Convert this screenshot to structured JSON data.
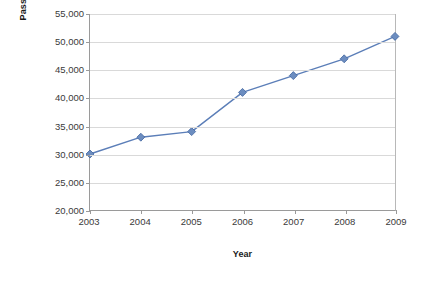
{
  "chart_data": {
    "type": "line",
    "title": "",
    "xlabel": "Year",
    "ylabel": "Passengers per day",
    "categories": [
      "2003",
      "2004",
      "2005",
      "2006",
      "2007",
      "2008",
      "2009"
    ],
    "values": [
      30000,
      33000,
      34000,
      41000,
      44000,
      47000,
      51000
    ],
    "series": [
      {
        "name": "Passengers per day",
        "values": [
          30000,
          33000,
          34000,
          41000,
          44000,
          47000,
          51000
        ]
      }
    ],
    "ylim": [
      20000,
      55000
    ],
    "ytick_step": 5000,
    "ytick_labels": [
      "20,000",
      "25,000",
      "30,000",
      "35,000",
      "40,000",
      "45,000",
      "50,000",
      "55,000"
    ],
    "ytick_values": [
      20000,
      25000,
      30000,
      35000,
      40000,
      45000,
      50000,
      55000
    ],
    "xtick_labels": [
      "2003",
      "2004",
      "2005",
      "2006",
      "2007",
      "2008",
      "2009"
    ],
    "grid": "horizontal",
    "legend": "none",
    "marker": "diamond",
    "colors": {
      "series_line": "#5B7EB8",
      "series_marker": "#6C8DC0",
      "marker_edge": "#41659F",
      "gridline": "#D9D9D9",
      "axis_line": "#9A9A9A",
      "plot_border_right": "#B8B8B8",
      "tick_label": "#3A3A3A",
      "axis_title": "#1A1A1A",
      "background": "#FFFFFF"
    }
  }
}
